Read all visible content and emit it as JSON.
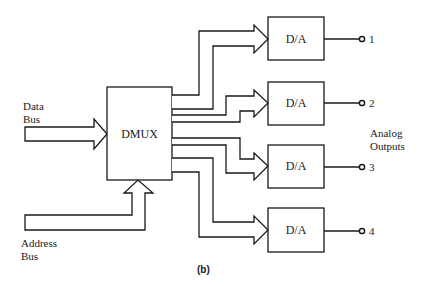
{
  "diagram": {
    "inputs": {
      "data_bus": {
        "line1": "Data",
        "line2": "Bus"
      },
      "address_bus": {
        "line1": "Address",
        "line2": "Bus"
      }
    },
    "demux": {
      "label": "DMUX"
    },
    "converters": [
      {
        "label": "D/A",
        "output": "1"
      },
      {
        "label": "D/A",
        "output": "2"
      },
      {
        "label": "D/A",
        "output": "3"
      },
      {
        "label": "D/A",
        "output": "4"
      }
    ],
    "outputs_label": {
      "line1": "Analog",
      "line2": "Outputs"
    },
    "caption": "(b)"
  }
}
